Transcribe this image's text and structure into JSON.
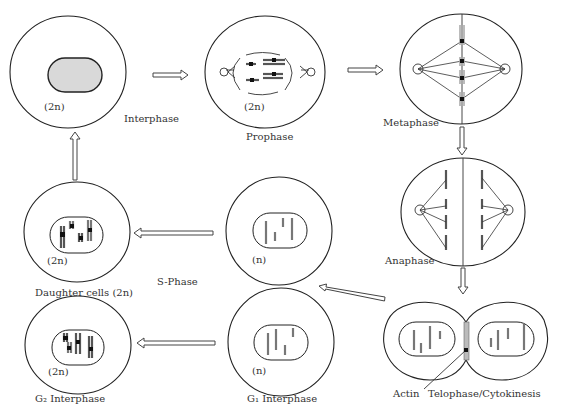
{
  "diagram": {
    "stages": [
      {
        "id": "interphase",
        "label": "Interphase",
        "ploidy": "(2n)"
      },
      {
        "id": "prophase",
        "label": "Prophase",
        "ploidy": "(2n)"
      },
      {
        "id": "metaphase",
        "label": "Metaphase"
      },
      {
        "id": "anaphase",
        "label": "Anaphase"
      },
      {
        "id": "telophase",
        "label": "Telophase/Cytokinesis",
        "annotation": "Actin"
      },
      {
        "id": "s-phase-cell",
        "label": "S-Phase",
        "ploidy": "(n)"
      },
      {
        "id": "daughter",
        "label": "Daughter cells (2n)",
        "ploidy": "(2n)"
      },
      {
        "id": "g1",
        "label": "G₁ Interphase",
        "ploidy": "(n)"
      },
      {
        "id": "g2",
        "label": "G₂ Interphase",
        "ploidy": "(2n)"
      }
    ],
    "flow": [
      "interphase -> prophase",
      "prophase -> metaphase",
      "metaphase -> anaphase",
      "anaphase -> telophase",
      "telophase -> s-phase-cell",
      "s-phase-cell -> daughter",
      "g1 -> g2",
      "daughter -> interphase"
    ]
  }
}
